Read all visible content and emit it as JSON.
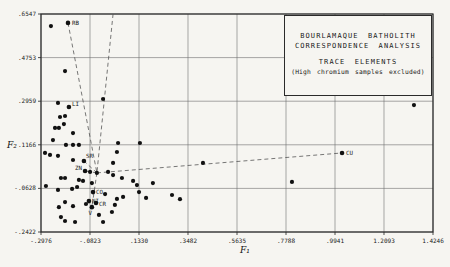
{
  "chart_data": {
    "type": "scatter",
    "title_lines": [
      "BOURLAMAQUE BATHOLITH",
      "CORRESPONDENCE ANALYSIS",
      "TRACE ELEMENTS",
      "(High chromium samples excluded)"
    ],
    "xlabel": "F₁",
    "ylabel": "F₂",
    "xlim": [
      -0.2976,
      1.4246
    ],
    "ylim": [
      -0.2422,
      0.6547
    ],
    "x_ticks": [
      -0.2976,
      -0.0823,
      0.133,
      0.3482,
      0.5635,
      0.7788,
      0.9941,
      1.2093,
      1.4246
    ],
    "x_tick_labels": [
      "-.2976",
      "-.0823",
      ".1330",
      ".3482",
      ".5635",
      ".7788",
      ".9941",
      "1.2093",
      "1.4246"
    ],
    "y_ticks": [
      0.6547,
      0.4753,
      0.2959,
      0.1166,
      -0.0628,
      -0.2422
    ],
    "y_tick_labels": [
      ".6547",
      ".4753",
      ".2959",
      ".1166",
      "-.0628",
      "-.2422"
    ],
    "grid": true,
    "point_color": "#111111",
    "line_color": "#2a2a2a",
    "dash_color": "#555555",
    "labeled_points": [
      {
        "label": "RB",
        "x": -0.179,
        "y": 0.618,
        "dx": 4,
        "dy": 2,
        "anchor": "start"
      },
      {
        "label": "LI",
        "x": -0.175,
        "y": 0.272,
        "dx": 3,
        "dy": -1,
        "anchor": "start"
      },
      {
        "label": "SR",
        "x": -0.109,
        "y": 0.05,
        "dx": 2,
        "dy": -3,
        "anchor": "start"
      },
      {
        "label": "ZN",
        "x": -0.104,
        "y": 0.009,
        "dx": -3,
        "dy": -1,
        "anchor": "end"
      },
      {
        "label": "CO",
        "x": -0.069,
        "y": -0.078,
        "dx": 3,
        "dy": 2,
        "anchor": "start"
      },
      {
        "label": "NI",
        "x": -0.087,
        "y": -0.115,
        "dx": 3,
        "dy": 2,
        "anchor": "start"
      },
      {
        "label": "CR",
        "x": -0.056,
        "y": -0.123,
        "dx": 3,
        "dy": 3,
        "anchor": "start"
      },
      {
        "label": "V",
        "x": -0.074,
        "y": -0.14,
        "dx": 0,
        "dy": 8,
        "anchor": "end"
      },
      {
        "label": "CU",
        "x": 1.025,
        "y": 0.083,
        "dx": 4,
        "dy": 2,
        "anchor": "start"
      }
    ],
    "points": [
      [
        -0.254,
        0.605
      ],
      [
        -0.192,
        0.42
      ],
      [
        -0.223,
        0.289
      ],
      [
        -0.025,
        0.305
      ],
      [
        1.341,
        0.28
      ],
      [
        -0.214,
        0.231
      ],
      [
        -0.192,
        0.235
      ],
      [
        -0.197,
        0.202
      ],
      [
        -0.236,
        0.186
      ],
      [
        -0.219,
        0.186
      ],
      [
        -0.157,
        0.165
      ],
      [
        -0.245,
        0.136
      ],
      [
        -0.188,
        0.116
      ],
      [
        -0.157,
        0.116
      ],
      [
        -0.131,
        0.116
      ],
      [
        0.041,
        0.124
      ],
      [
        0.137,
        0.124
      ],
      [
        -0.28,
        0.083
      ],
      [
        -0.258,
        0.075
      ],
      [
        -0.223,
        0.071
      ],
      [
        -0.157,
        0.054
      ],
      [
        0.036,
        0.087
      ],
      [
        0.019,
        0.042
      ],
      [
        -0.052,
        0.001
      ],
      [
        -0.082,
        0.005
      ],
      [
        -0.003,
        0.005
      ],
      [
        0.019,
        -0.008
      ],
      [
        -0.21,
        -0.02
      ],
      [
        -0.192,
        -0.02
      ],
      [
        -0.131,
        -0.028
      ],
      [
        -0.113,
        -0.032
      ],
      [
        -0.074,
        -0.041
      ],
      [
        -0.276,
        -0.053
      ],
      [
        -0.223,
        -0.069
      ],
      [
        -0.161,
        -0.065
      ],
      [
        -0.139,
        -0.057
      ],
      [
        -0.016,
        -0.086
      ],
      [
        0.058,
        -0.02
      ],
      [
        0.107,
        -0.032
      ],
      [
        0.124,
        -0.049
      ],
      [
        0.194,
        -0.041
      ],
      [
        0.133,
        -0.078
      ],
      [
        0.164,
        -0.102
      ],
      [
        0.063,
        -0.098
      ],
      [
        0.036,
        -0.106
      ],
      [
        -0.1,
        -0.127
      ],
      [
        -0.192,
        -0.119
      ],
      [
        -0.219,
        -0.14
      ],
      [
        -0.157,
        -0.136
      ],
      [
        -0.21,
        -0.181
      ],
      [
        -0.192,
        -0.197
      ],
      [
        -0.148,
        -0.201
      ],
      [
        -0.025,
        -0.201
      ],
      [
        -0.043,
        -0.172
      ],
      [
        0.014,
        -0.16
      ],
      [
        0.027,
        -0.131
      ],
      [
        0.278,
        -0.09
      ],
      [
        0.313,
        -0.107
      ],
      [
        0.414,
        0.042
      ],
      [
        0.805,
        -0.036
      ]
    ],
    "dashed_paths": [
      [
        [
          -0.179,
          0.618
        ],
        [
          -0.052,
          0.001
        ]
      ],
      [
        [
          0.019,
          0.6547
        ],
        [
          -0.052,
          0.001
        ]
      ],
      [
        [
          -0.052,
          0.001
        ],
        [
          1.025,
          0.083
        ]
      ],
      [
        [
          -0.052,
          0.001
        ],
        [
          -0.074,
          -0.14
        ]
      ],
      [
        [
          -0.052,
          0.001
        ],
        [
          -0.109,
          0.05
        ]
      ],
      [
        [
          -0.052,
          0.001
        ],
        [
          -0.104,
          0.009
        ]
      ]
    ]
  }
}
